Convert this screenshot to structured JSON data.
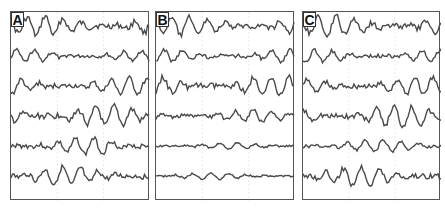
{
  "figure": {
    "panels": [
      {
        "label": "A",
        "traces": 6,
        "left": 10,
        "width": 139
      },
      {
        "label": "B",
        "traces": 6,
        "left": 155,
        "width": 139
      },
      {
        "label": "C",
        "traces": 6,
        "left": 302,
        "width": 138
      }
    ],
    "colors": {
      "trace": "#4a4a4a",
      "border": "#555555",
      "grid": "#dddddd",
      "background": "#ffffff"
    }
  }
}
